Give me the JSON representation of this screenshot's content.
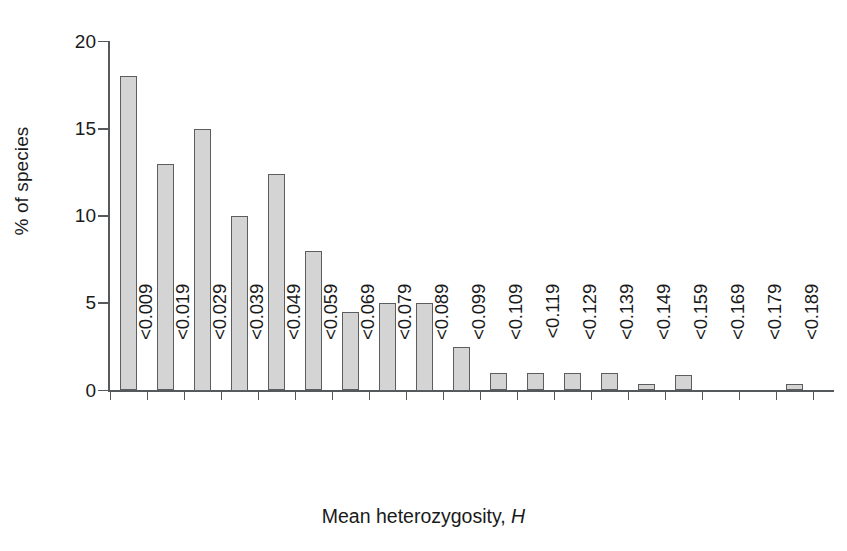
{
  "chart_data": {
    "type": "bar",
    "title": "",
    "xlabel": "Mean heterozygosity, H",
    "xlabel_plain": "Mean heterozygosity,",
    "xlabel_symbol": "H",
    "ylabel": "% of species",
    "ylim": [
      0,
      20
    ],
    "yticks": [
      0,
      5,
      10,
      15,
      20
    ],
    "ytick_labels": [
      "0",
      "5",
      "10",
      "15",
      "20"
    ],
    "grid": false,
    "legend": null,
    "categories": [
      "<0.009",
      "<0.019",
      "<0.029",
      "<0.039",
      "<0.049",
      "<0.059",
      "<0.069",
      "<0.079",
      "<0.089",
      "<0.099",
      "<0.109",
      "<0.119",
      "<0.129",
      "<0.139",
      "<0.149",
      "<0.159",
      "<0.169",
      "<0.179",
      "<0.189"
    ],
    "values": [
      18.0,
      13.0,
      15.0,
      10.0,
      12.4,
      8.0,
      4.5,
      5.0,
      5.0,
      2.5,
      1.0,
      1.0,
      1.0,
      1.0,
      0.4,
      0.9,
      0.0,
      0.0,
      0.4
    ],
    "bar_fill_color": "#d4d4d4",
    "bar_edge_color": "#5a5e61",
    "axis_color": "#55595c"
  }
}
